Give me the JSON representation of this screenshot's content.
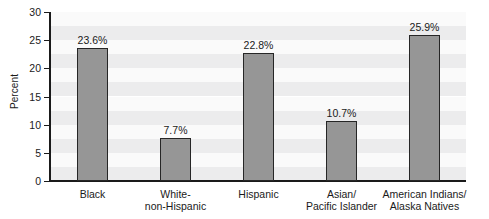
{
  "chart_data": {
    "type": "bar",
    "title": "",
    "xlabel": "",
    "ylabel": "Percent",
    "ylim": [
      0,
      30
    ],
    "yticks": [
      0,
      5,
      10,
      15,
      20,
      25,
      30
    ],
    "ytick_labels": [
      "0",
      "5",
      "10",
      "15",
      "20",
      "25",
      "30"
    ],
    "grid": "horizontal alternating bands",
    "legend": "none",
    "categories": [
      "Black",
      "White- non-Hispanic",
      "Hispanic",
      "Asian/ Pacific Islander",
      "American Indians/ Alaska Natives"
    ],
    "category_lines": [
      [
        "Black",
        ""
      ],
      [
        "White-",
        "non-Hispanic"
      ],
      [
        "Hispanic",
        ""
      ],
      [
        "Asian/",
        "Pacific Islander"
      ],
      [
        "American Indians/",
        "Alaska Natives"
      ]
    ],
    "values": [
      23.6,
      7.7,
      22.8,
      10.7,
      25.9
    ],
    "value_labels": [
      "23.6%",
      "7.7%",
      "22.8%",
      "10.7%",
      "25.9%"
    ],
    "colors": {
      "bar_fill": "#969696",
      "bar_edge": "#262626",
      "axis": "#1a1a1a",
      "text": "#1a1a1a",
      "band_light": "#fafafa",
      "band_dark": "#ececed",
      "background": "#ffffff"
    }
  }
}
